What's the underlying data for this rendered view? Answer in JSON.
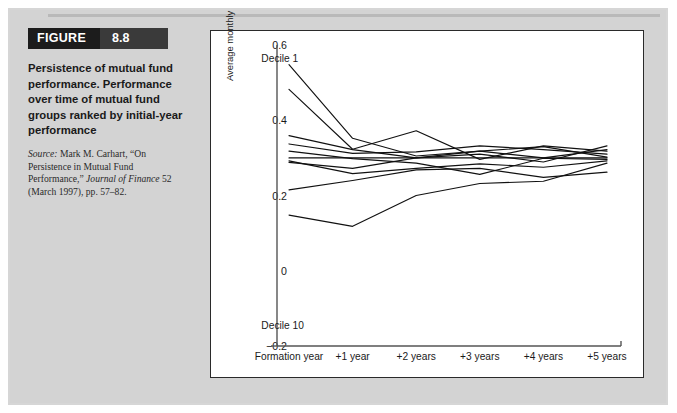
{
  "figure": {
    "label": "FIGURE",
    "number": "8.8",
    "caption": "Persistence of mutual fund performance. Performance over time of mutual fund groups ranked by initial-year performance",
    "source_lead": "Source:",
    "source_rest_1": " Mark M. Carhart, “On Persistence in Mutual Fund Performance,” ",
    "source_italic": "Journal of Finance",
    "source_rest_2": " 52 (March 1997), pp. 57–82."
  },
  "chart_data": {
    "type": "line",
    "title": "",
    "xlabel": "",
    "ylabel": "Average monthly excess return (%)",
    "categories": [
      "Formation year",
      "+1 year",
      "+2 years",
      "+3 years",
      "+4 years",
      "+5 years"
    ],
    "ylim": [
      -0.2,
      0.6
    ],
    "yticks": [
      0.6,
      0.4,
      0.2,
      0,
      -0.2
    ],
    "ytick_labels": [
      "0.6",
      "0.4",
      "0.2",
      "0",
      "−0.2"
    ],
    "grid": false,
    "legend": "none",
    "annotations": [
      {
        "text": "Decile 1",
        "x": 0.02,
        "y": 0.565
      },
      {
        "text": "Decile 10",
        "x": 0.02,
        "y": -0.145
      }
    ],
    "series": [
      {
        "name": "Decile 1",
        "values": [
          0.548,
          0.352,
          0.305,
          0.318,
          0.3,
          0.322
        ]
      },
      {
        "name": "Decile 2",
        "values": [
          0.482,
          0.323,
          0.372,
          0.296,
          0.332,
          0.318
        ]
      },
      {
        "name": "Decile 3",
        "values": [
          0.359,
          0.322,
          0.3,
          0.31,
          0.289,
          0.332
        ]
      },
      {
        "name": "Decile 4",
        "values": [
          0.337,
          0.312,
          0.316,
          0.332,
          0.322,
          0.31
        ]
      },
      {
        "name": "Decile 5",
        "values": [
          0.318,
          0.298,
          0.286,
          0.256,
          0.299,
          0.296
        ]
      },
      {
        "name": "Decile 6",
        "values": [
          0.3,
          0.3,
          0.3,
          0.3,
          0.3,
          0.3
        ]
      },
      {
        "name": "Decile 7",
        "values": [
          0.292,
          0.258,
          0.272,
          0.284,
          0.275,
          0.292
        ]
      },
      {
        "name": "Decile 8",
        "values": [
          0.288,
          0.272,
          0.3,
          0.318,
          0.33,
          0.302
        ]
      },
      {
        "name": "Decile 9",
        "values": [
          0.215,
          0.24,
          0.268,
          0.272,
          0.248,
          0.262
        ]
      },
      {
        "name": "Decile 10",
        "values": [
          0.148,
          0.118,
          0.2,
          0.232,
          0.238,
          0.286
        ]
      }
    ]
  }
}
